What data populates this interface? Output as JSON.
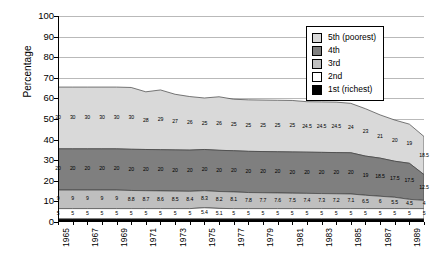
{
  "chart_data": {
    "type": "area",
    "title": "",
    "xlabel": "",
    "ylabel": "Percentage",
    "ylim": [
      0,
      100
    ],
    "ytick_step": 10,
    "yticks": [
      0,
      10,
      20,
      30,
      40,
      50,
      60,
      70,
      80,
      90,
      100
    ],
    "grid": true,
    "stacked": true,
    "legend_position": "top-right",
    "x": [
      1965,
      1966,
      1967,
      1968,
      1969,
      1970,
      1971,
      1972,
      1973,
      1974,
      1975,
      1976,
      1977,
      1978,
      1979,
      1980,
      1981,
      1982,
      1983,
      1984,
      1985,
      1986,
      1987,
      1988,
      1989,
      1990
    ],
    "xtick_labels": [
      "1965",
      "1967",
      "1969",
      "1971",
      "1973",
      "1975",
      "1977",
      "1979",
      "1981",
      "1983",
      "1985",
      "1987",
      "1989"
    ],
    "series": [
      {
        "name": "5th (poorest)",
        "color": "#d9d9d9",
        "values": [
          30,
          30,
          30,
          30,
          30,
          30,
          28,
          29,
          27,
          26,
          25,
          26,
          25,
          25,
          25,
          25,
          25,
          24.5,
          24.5,
          24.5,
          24,
          23,
          21,
          20,
          19,
          18.5
        ]
      },
      {
        "name": "4th",
        "color": "#7f7f7f",
        "values": [
          20,
          20,
          20,
          20,
          20,
          20,
          20,
          20,
          20,
          20,
          20,
          20,
          20,
          20,
          20,
          20,
          20,
          20,
          20,
          20,
          20,
          19,
          18.5,
          17.5,
          17.5,
          12.5
        ]
      },
      {
        "name": "3rd",
        "color": "#bfbfbf",
        "values": [
          9,
          9,
          9,
          9,
          9,
          8.8,
          8.7,
          8.6,
          8.5,
          8.4,
          8.3,
          8.2,
          8.1,
          7.8,
          7.7,
          7.6,
          7.5,
          7.4,
          7.3,
          7.2,
          7.1,
          6.5,
          6,
          5.5,
          4.5,
          4
        ]
      },
      {
        "name": "2nd",
        "color": "#ffffff",
        "values": [
          5,
          5,
          5,
          5,
          5,
          5,
          5,
          5,
          5,
          5,
          5.4,
          5.1,
          5,
          5,
          5,
          5,
          5,
          5,
          5,
          5,
          5,
          5,
          5,
          5,
          5,
          5
        ]
      },
      {
        "name": "1st (richest)",
        "color": "#000000",
        "values": [
          1.5,
          1.5,
          1.5,
          1.5,
          1.5,
          1.5,
          1.5,
          1.5,
          1.5,
          1.5,
          1.5,
          1.5,
          1.5,
          1.5,
          1.5,
          1.5,
          1.5,
          1.5,
          1.5,
          1.5,
          1.5,
          1.5,
          1.5,
          1.5,
          1.5,
          1.5
        ]
      }
    ],
    "labels_top": [
      "30",
      "30",
      "30",
      "30",
      "30",
      "30",
      "28",
      "29",
      "27",
      "26",
      "25",
      "26",
      "25",
      "25",
      "25",
      "25",
      "25",
      "24.5",
      "24.5",
      "24.5",
      "24",
      "23",
      "21",
      "20",
      "19",
      "18.5",
      "18"
    ],
    "labels_row2": [
      "20",
      "20",
      "20",
      "20",
      "20",
      "20",
      "20",
      "20",
      "20",
      "20",
      "20",
      "20",
      "20",
      "20",
      "20",
      "20",
      "20",
      "20",
      "20",
      "20",
      "20",
      "19",
      "18.5",
      "17.5",
      "17.5",
      "12.5"
    ],
    "labels_row3": [
      "9",
      "9",
      "9",
      "9",
      "9",
      "8.8",
      "8.7",
      "8.6",
      "8.5",
      "8.4",
      "8.3",
      "8.2",
      "8.1",
      "7.8",
      "7.7",
      "7.6",
      "7.5",
      "7.4",
      "7.3",
      "7.2",
      "7.1",
      "6.5",
      "6",
      "5.5",
      "4.5",
      "4"
    ],
    "labels_row4": [
      "5",
      "5",
      "5",
      "5",
      "5",
      "5",
      "5",
      "5",
      "5",
      "5",
      "5.4",
      "5.1",
      "5",
      "5",
      "5",
      "5",
      "5",
      "5",
      "5",
      "5",
      "5",
      "5",
      "5",
      "5",
      "5",
      "5"
    ]
  },
  "legend": {
    "items": [
      {
        "label": "5th (poorest)",
        "color": "#d9d9d9"
      },
      {
        "label": "4th",
        "color": "#7f7f7f"
      },
      {
        "label": "3rd",
        "color": "#bfbfbf"
      },
      {
        "label": "2nd",
        "color": "#ffffff"
      },
      {
        "label": "1st (richest)",
        "color": "#000000"
      }
    ]
  }
}
